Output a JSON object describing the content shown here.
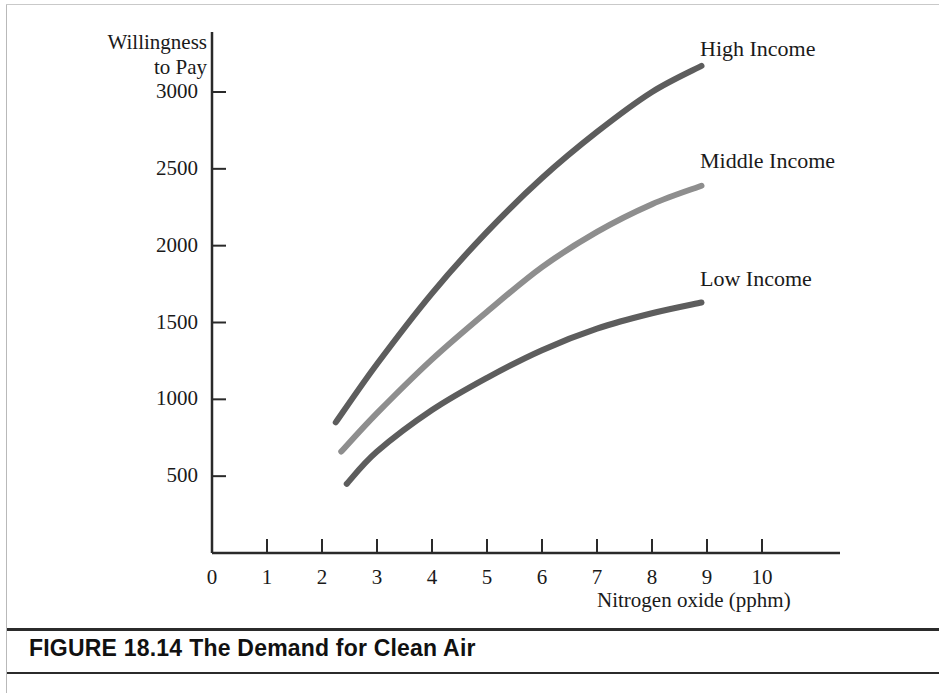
{
  "figure": {
    "caption_prefix": "FIGURE 18.14",
    "caption_title": "The Demand for Clean Air"
  },
  "chart_data": {
    "type": "line",
    "title": "The Demand for Clean Air",
    "xlabel": "Nitrogen oxide (pphm)",
    "ylabel": "Willingness to Pay",
    "ylabel_line1": "Willingness",
    "ylabel_line2": "to Pay",
    "xlim": [
      0,
      11
    ],
    "ylim": [
      0,
      3350
    ],
    "grid": false,
    "legend_position": "right-of-curve-ends",
    "xticks": [
      0,
      1,
      2,
      3,
      4,
      5,
      6,
      7,
      8,
      9,
      10
    ],
    "xtick_labels": [
      "0",
      "1",
      "2",
      "3",
      "4",
      "5",
      "6",
      "7",
      "8",
      "9",
      "10"
    ],
    "yticks": [
      500,
      1000,
      1500,
      2000,
      2500,
      3000
    ],
    "ytick_labels": [
      "500",
      "1000",
      "1500",
      "2000",
      "2500",
      "3000"
    ],
    "series": [
      {
        "name": "High Income",
        "color": "#5d5d5d",
        "x": [
          2.25,
          3.0,
          4.0,
          5.0,
          6.0,
          7.0,
          8.0,
          8.9
        ],
        "values": [
          850,
          1230,
          1690,
          2090,
          2440,
          2740,
          3000,
          3170
        ]
      },
      {
        "name": "Middle Income",
        "color": "#8e8e8e",
        "x": [
          2.35,
          3.0,
          4.0,
          5.0,
          6.0,
          7.0,
          8.0,
          8.9
        ],
        "values": [
          660,
          910,
          1260,
          1570,
          1860,
          2090,
          2270,
          2390
        ]
      },
      {
        "name": "Low Income",
        "color": "#5d5d5d",
        "x": [
          2.45,
          3.0,
          4.0,
          5.0,
          6.0,
          7.0,
          8.0,
          8.9
        ],
        "values": [
          450,
          660,
          930,
          1140,
          1320,
          1460,
          1560,
          1630
        ]
      }
    ],
    "annotations": [
      {
        "text": "High Income",
        "x_px": 700,
        "y_px": 36
      },
      {
        "text": "Middle Income",
        "x_px": 700,
        "y_px": 148
      },
      {
        "text": "Low Income",
        "x_px": 700,
        "y_px": 266
      }
    ]
  }
}
